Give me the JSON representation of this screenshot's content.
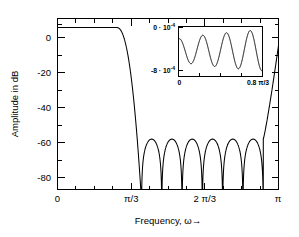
{
  "figure": {
    "title": "",
    "background_color": "#ffffff",
    "line_color": "#000000"
  },
  "chart_data": {
    "type": "line",
    "title": "",
    "subtitle": "",
    "xlabel": "Frequency, ω→",
    "ylabel": "Amplitude in dB",
    "xlim": [
      0,
      3.14159265
    ],
    "ylim": [
      -90,
      5
    ],
    "grid": false,
    "legend": null,
    "xticks": [
      0,
      1.0471976,
      2.0943951,
      3.1415927
    ],
    "xticklabels": [
      "0",
      "π/3",
      "2 π/3",
      "π"
    ],
    "yticks": [
      0,
      -20,
      -40,
      -60,
      -80
    ],
    "yticklabels": [
      "0",
      "-20",
      "-40",
      "-60",
      "-80"
    ],
    "x_minor_tick_count": 3,
    "y_minor_tick_count": 1,
    "series": [
      {
        "name": "Magnitude response",
        "passband_level_db": 0,
        "passband_edge": 0.837758,
        "transition_start": 1.0053096,
        "transition_end": 1.1938052,
        "stopband_ripple_db": -62,
        "stopband_nulls": [
          1.1938052,
          1.288053,
          1.508,
          1.7279,
          1.9478,
          2.1677,
          2.3876,
          2.6075,
          2.8274,
          2.9216
        ],
        "stopband_peaks_db": [
          -62,
          -62.5,
          -62,
          -62.5,
          -62,
          -62.5
        ],
        "value_at_pi_db": -10,
        "floor_db": -90
      }
    ],
    "inset": {
      "type": "line",
      "title": "",
      "xlabel": "",
      "ylabel": "",
      "xlim": [
        0,
        0.837758
      ],
      "ylim": [
        -0.0009,
        5e-05
      ],
      "xticks": [
        0,
        0.837758
      ],
      "xticklabels": [
        "0",
        "0.8 π/3"
      ],
      "x_minor_tick_count": 3,
      "yticks": [
        0,
        -0.0008
      ],
      "yticklabels": [
        "0 · 10",
        "-8 · 10"
      ],
      "ytick_exponents": [
        "-4",
        "-4"
      ],
      "description": "Zoom of the passband showing equiripple deviation between 0 and -8e-4.",
      "ripple_cycles": 3.5,
      "ripple_min": -0.0008,
      "ripple_max": 0.0
    }
  },
  "labels": {
    "y_axis": "Amplitude in dB",
    "x_axis": "Frequency, ω→"
  }
}
